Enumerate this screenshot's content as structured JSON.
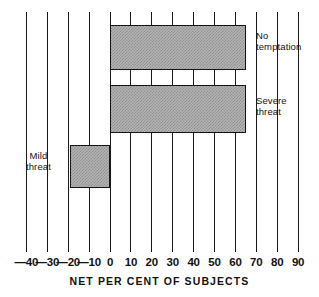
{
  "chart_data": {
    "type": "bar",
    "orientation": "horizontal",
    "title": "",
    "subtitle": "",
    "xlabel": "NET PER CENT OF SUBJECTS",
    "ylabel": "",
    "xlim": [
      -45,
      95
    ],
    "xticks": [
      -40,
      -30,
      -20,
      -10,
      0,
      10,
      20,
      30,
      40,
      50,
      60,
      70,
      80,
      90
    ],
    "xtick_labels": [
      "—40",
      "—30",
      "—20",
      "—10",
      "0",
      "10",
      "20",
      "30",
      "40",
      "50",
      "60",
      "70",
      "80",
      "90"
    ],
    "grid": "vertical",
    "legend": "none",
    "categories": [
      "No temptation",
      "Severe threat",
      "Mild threat"
    ],
    "values": [
      65,
      65,
      -19
    ],
    "bars": [
      {
        "label": "No temptation",
        "value": 65,
        "label_text": "No\ntemptation",
        "label_side": "right"
      },
      {
        "label": "Severe threat",
        "value": 65,
        "label_text": "Severe\nthreat",
        "label_side": "right"
      },
      {
        "label": "Mild threat",
        "value": -19,
        "label_text": "Mild\nthreat",
        "label_side": "left"
      }
    ],
    "bar_fill_color": "#b4b4b4",
    "bar_edge_color": "#141414",
    "gridline_color": "#1a1a1a",
    "axis_text_color": "#111111",
    "background_color": "#ffffff"
  },
  "axis": {
    "title": "NET PER CENT OF SUBJECTS",
    "ticks": [
      {
        "value": -40,
        "label": "—40"
      },
      {
        "value": -30,
        "label": "—30"
      },
      {
        "value": -20,
        "label": "—20"
      },
      {
        "value": -10,
        "label": "—10"
      },
      {
        "value": 0,
        "label": "0"
      },
      {
        "value": 10,
        "label": "10"
      },
      {
        "value": 20,
        "label": "20"
      },
      {
        "value": 30,
        "label": "30"
      },
      {
        "value": 40,
        "label": "40"
      },
      {
        "value": 50,
        "label": "50"
      },
      {
        "value": 60,
        "label": "60"
      },
      {
        "value": 70,
        "label": "70"
      },
      {
        "value": 80,
        "label": "80"
      },
      {
        "value": 90,
        "label": "90"
      }
    ]
  },
  "labels": {
    "no_temptation": "No\ntemptation",
    "severe_threat": "Severe\nthreat",
    "mild_threat": "Mild\nthreat"
  }
}
